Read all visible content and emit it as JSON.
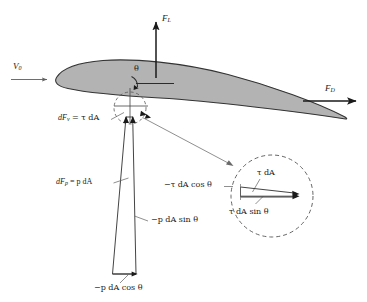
{
  "figure": {
    "type": "free-body-diagram",
    "colors": {
      "airfoil_fill": "#b3b3b3",
      "airfoil_stroke": "#333333",
      "line": "#444444",
      "leader": "#555555",
      "background": "#ffffff",
      "text": "#1a1a1a"
    }
  },
  "labels": {
    "lift_force": "F",
    "lift_force_sub": "L",
    "freestream_velocity": "V",
    "freestream_velocity_sub": "0",
    "drag_force": "F",
    "drag_force_sub": "D",
    "angle": "θ",
    "shear_force": "dF",
    "shear_force_sub": "v",
    "shear_force_rhs": " = τ dA",
    "pressure_force": "dF",
    "pressure_force_sub": "p",
    "pressure_force_rhs": " = p dA",
    "pressure_sin_component": "−p dA sin θ",
    "pressure_cos_component": "−p dA cos θ",
    "inset_shear": "τ dA",
    "inset_shear_cos": "−τ dA cos θ",
    "inset_shear_sin": "τ dA sin θ"
  },
  "geometry": {
    "surface_point": [
      130,
      108
    ],
    "detail_circle_radius": 16,
    "inset_circle_center": [
      272,
      196
    ],
    "inset_circle_radius": 41
  }
}
